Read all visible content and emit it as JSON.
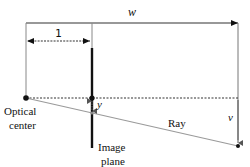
{
  "diagram": {
    "labels": {
      "width": "w",
      "unit_distance": "1",
      "image_coord": "y",
      "world_coord": "v",
      "optical_center_line1": "Optical",
      "optical_center_line2": "center",
      "image_plane_line1": "Image",
      "image_plane_line2": "plane",
      "ray": "Ray"
    },
    "colors": {
      "line": "#111111",
      "ray": "#9a9a9a",
      "frame": "#777777"
    },
    "nodes": [
      {
        "id": "optical-center",
        "x": 26,
        "y": 98
      },
      {
        "id": "image-plane-axis-point",
        "x": 92,
        "y": 98
      },
      {
        "id": "image-point",
        "x": 92,
        "y": 113
      },
      {
        "id": "world-point",
        "x": 238,
        "y": 146
      }
    ],
    "edges": [
      {
        "from": "optical-center",
        "to": "world-point",
        "label": "Ray"
      },
      {
        "from": "optical-center",
        "to": "right-frame",
        "style": "dashed",
        "label": "optical axis"
      }
    ]
  }
}
